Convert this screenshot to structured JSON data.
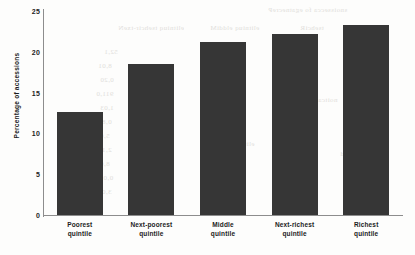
{
  "chart_data": {
    "type": "bar",
    "title": "",
    "subtitle": "",
    "xlabel": "",
    "ylabel": "Percentage of accessions",
    "categories": [
      "Poorest quintile",
      "Next-poorest quintile",
      "Middle quintile",
      "Next-richest quintile",
      "Richest quintile"
    ],
    "category_lines": [
      [
        "Poorest",
        "quintile"
      ],
      [
        "Next-poorest",
        "quintile"
      ],
      [
        "Middle",
        "quintile"
      ],
      [
        "Next-richest",
        "quintile"
      ],
      [
        "Richest",
        "quintile"
      ]
    ],
    "values": [
      12.6,
      18.5,
      21.2,
      22.2,
      23.3
    ],
    "ylim": [
      0,
      25
    ],
    "yticks": [
      0,
      5,
      10,
      15,
      20,
      25
    ],
    "ytick_labels": [
      "0",
      "5",
      "10",
      "15",
      "20",
      "25"
    ],
    "grid": false,
    "legend": null,
    "legend_position": "none",
    "bar_color": "#363636",
    "axis_color": "#8d8d8d",
    "text_color": "#1c1c1c",
    "background_color": "#fdfdfc"
  },
  "artifacts": {
    "description": "faint bleed-through text from reverse page of scan",
    "fragments": [
      {
        "text": "snoissecca fo egatnecreP",
        "x": 268,
        "y": 6
      },
      {
        "text": "elitniuq tsehcir-txeN",
        "x": 118,
        "y": 24
      },
      {
        "text": "elitniuq elddiM",
        "x": 210,
        "y": 24
      },
      {
        "text": "tsehciR",
        "x": 300,
        "y": 24
      },
      {
        "text": "52,1",
        "x": 104,
        "y": 48
      },
      {
        "text": "8,01",
        "x": 98,
        "y": 62
      },
      {
        "text": "0,20",
        "x": 100,
        "y": 76
      },
      {
        "text": "911,0",
        "x": 96,
        "y": 90
      },
      {
        "text": "1,03",
        "x": 100,
        "y": 104
      },
      {
        "text": "0,8012",
        "x": 90,
        "y": 118
      },
      {
        "text": "5,0031",
        "x": 88,
        "y": 132
      },
      {
        "text": "2,1018",
        "x": 90,
        "y": 146
      },
      {
        "text": "8,0084",
        "x": 88,
        "y": 160
      },
      {
        "text": "0,0111",
        "x": 92,
        "y": 174
      },
      {
        "text": "3,0091",
        "x": 90,
        "y": 188
      },
      {
        "text": "elitniuq",
        "x": 230,
        "y": 140
      },
      {
        "text": "noitca",
        "x": 318,
        "y": 96
      },
      {
        "text": "atad",
        "x": 340,
        "y": 150
      }
    ]
  }
}
